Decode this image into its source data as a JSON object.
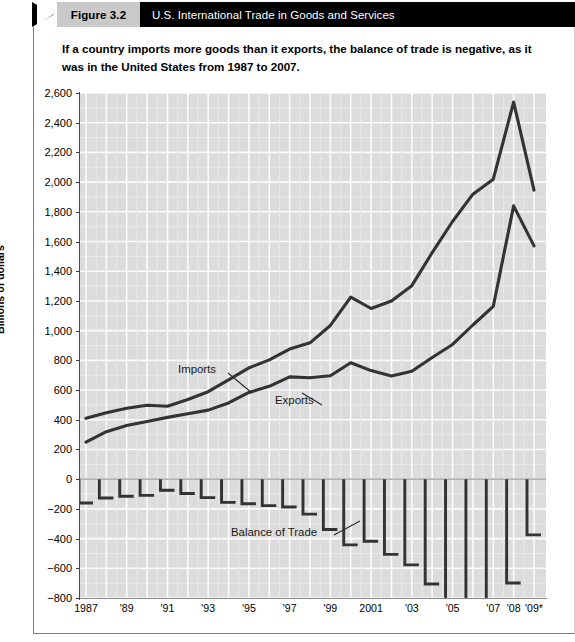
{
  "header": {
    "figure_badge": "Figure 3.2",
    "title": "U.S. International Trade in Goods and Services",
    "badge_bg": "#c9c9c9",
    "bar_bg": "#000000",
    "title_color": "#ffffff"
  },
  "caption": "If a country imports more goods than it exports, the balance of trade is negative, as it was in the United States from 1987 to 2007.",
  "footnote": "",
  "axis": {
    "y_title": "Billions of dollars",
    "y_ticks": [
      "2,600",
      "2,400",
      "2,200",
      "2,000",
      "1,800",
      "1,600",
      "1,400",
      "1,200",
      "1,000",
      "800",
      "600",
      "400",
      "200",
      "0",
      "−200",
      "−400",
      "−600",
      "−800"
    ],
    "x_ticks": [
      "1987",
      "'89",
      "'91",
      "'93",
      "'95",
      "'97",
      "'99",
      "2001",
      "'03",
      "'05",
      "'07",
      "'08",
      "'09*"
    ]
  },
  "series_labels": {
    "imports": "Imports",
    "exports": "Exports",
    "balance": "Balance of Trade"
  },
  "colors": {
    "plot_bg": "#dcdcdc",
    "grid": "#f4f4f4",
    "line": "#333333",
    "axis": "#4a4a4a"
  },
  "chart_data": {
    "type": "line",
    "title": "U.S. International Trade in Goods and Services",
    "subtitle": "If a country imports more goods than it exports, the balance of trade is negative, as it was in the United States from 1987 to 2007.",
    "xlabel": "",
    "ylabel": "Billions of dollars",
    "ylim": [
      -800,
      2600
    ],
    "ytick_step": 200,
    "grid": true,
    "legend": "inline-annotations",
    "x": [
      1987,
      1988,
      1989,
      1990,
      1991,
      1992,
      1993,
      1994,
      1995,
      1996,
      1997,
      1998,
      1999,
      2000,
      2001,
      2002,
      2003,
      2004,
      2005,
      2006,
      2007,
      2008,
      2009
    ],
    "x_tick_labels": [
      "1987",
      "'89",
      "'91",
      "'93",
      "'95",
      "'97",
      "'99",
      "2001",
      "'03",
      "'05",
      "'07",
      "'08",
      "'09*"
    ],
    "x_tick_years": [
      1987,
      1989,
      1991,
      1993,
      1995,
      1997,
      1999,
      2001,
      2003,
      2005,
      2007,
      2008,
      2009
    ],
    "series": [
      {
        "name": "Imports",
        "style": "line",
        "values": [
          410,
          447,
          477,
          498,
          491,
          536,
          589,
          669,
          749,
          803,
          876,
          918,
          1035,
          1226,
          1149,
          1200,
          1303,
          1525,
          1735,
          1919,
          2020,
          2539,
          1946
        ]
      },
      {
        "name": "Exports",
        "style": "line",
        "values": [
          250,
          320,
          362,
          389,
          416,
          440,
          465,
          513,
          584,
          625,
          689,
          683,
          696,
          784,
          731,
          694,
          726,
          819,
          907,
          1038,
          1163,
          1840,
          1571
        ]
      },
      {
        "name": "Balance of Trade",
        "style": "step-bar",
        "values": [
          -160,
          -127,
          -115,
          -109,
          -75,
          -96,
          -124,
          -156,
          -165,
          -178,
          -187,
          -235,
          -339,
          -442,
          -418,
          -506,
          -577,
          -706,
          -828,
          -881,
          -857,
          -699,
          -375
        ]
      }
    ],
    "annotations": [
      {
        "text": "Imports",
        "x": 1992,
        "y": 1010
      },
      {
        "text": "Exports",
        "x": 1996,
        "y": 790
      },
      {
        "text": "Balance of Trade",
        "x": 1995,
        "y": -310
      }
    ]
  }
}
